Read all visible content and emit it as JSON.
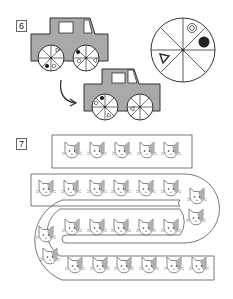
{
  "questions": [
    {
      "number": "6",
      "type": "car-wheel-puzzle"
    },
    {
      "number": "7",
      "type": "cat-sequence-puzzle"
    }
  ],
  "puzzle6": {
    "reference_wheel": {
      "segments": 8,
      "symbols": [
        "double-circle",
        "filled-circle",
        "triangle"
      ]
    },
    "car_colors": {
      "body": "#a9a9a9",
      "outline": "#333333"
    },
    "arrow": "curved-arrow-right"
  },
  "puzzle7": {
    "rows": [
      {
        "count": 5
      },
      {
        "count": 7
      },
      {
        "count": 8
      },
      {
        "count": 8
      }
    ],
    "colors": {
      "patch": "#b0b0b0",
      "outline": "#555555"
    }
  }
}
